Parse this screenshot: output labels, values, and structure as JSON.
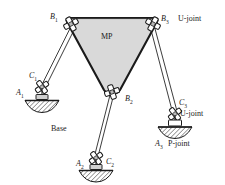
{
  "figure": {
    "background_color": "#ffffff",
    "platform_fill": "#d9d9d9",
    "line_color": "#1a1a1a"
  },
  "labels": {
    "platform": "MP",
    "base": "Base",
    "b1": "B",
    "b1_sub": "1",
    "b2": "B",
    "b2_sub": "2",
    "b3": "B",
    "b3_sub": "3",
    "b3_note": "U-joint",
    "c1": "C",
    "c1_sub": "1",
    "c2": "C",
    "c2_sub": "2",
    "c3": "C",
    "c3_sub": "3",
    "c3_note": "U-joint",
    "a1": "A",
    "a1_sub": "1",
    "a2": "A",
    "a2_sub": "2",
    "a3": "A",
    "a3_sub": "3",
    "a3_note": "P-joint"
  },
  "icons": {
    "u_joint": "universal-joint-cross",
    "p_joint": "prismatic-joint-block",
    "ground": "hatched-ground-support"
  },
  "geometry": {
    "platform_vertices": "B1 top-left, B3 top-right, B2 bottom-center",
    "legs": [
      {
        "from": "B1",
        "to": "C1",
        "base": "A1"
      },
      {
        "from": "B2",
        "to": "C2",
        "base": "A2"
      },
      {
        "from": "B3",
        "to": "C3",
        "base": "A3"
      }
    ]
  }
}
